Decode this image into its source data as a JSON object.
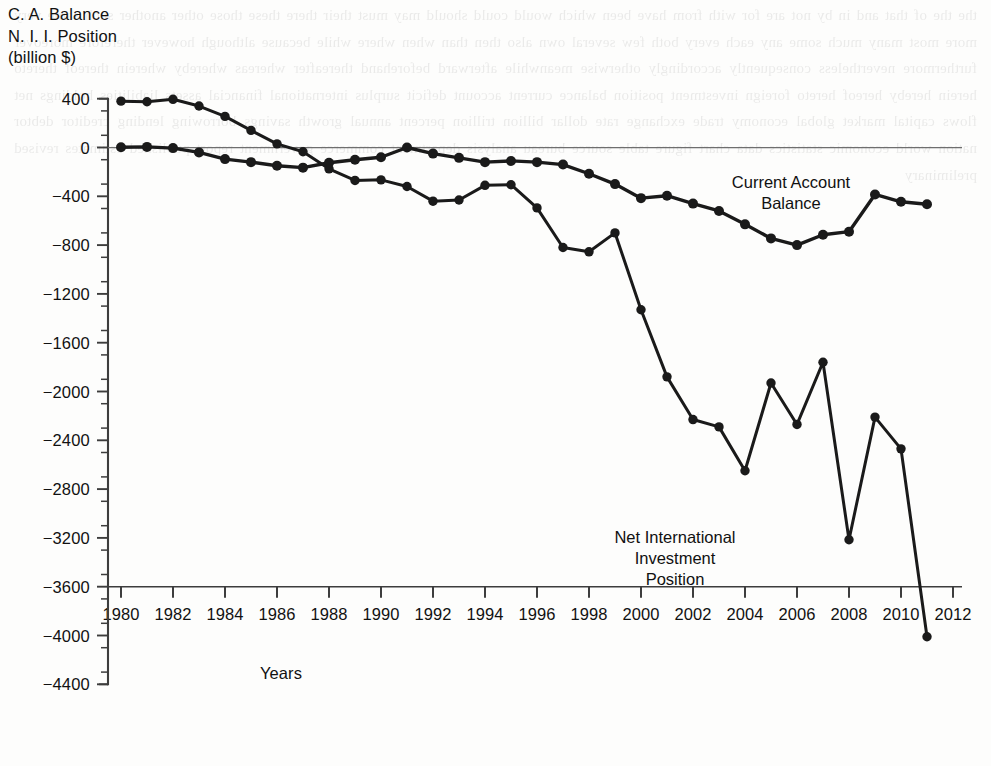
{
  "axes": {
    "y_title": "C. A. Balance\nN. I. I. Position\n(billion $)",
    "x_title": "Years",
    "y_ticks": [
      "400",
      "0",
      "−400",
      "−800",
      "−1200",
      "−1600",
      "−2000",
      "−2400",
      "−2800",
      "−3200",
      "−3600",
      "−4000",
      "−4400"
    ],
    "x_ticks": [
      "1980",
      "1982",
      "1984",
      "1986",
      "1988",
      "1990",
      "1992",
      "1994",
      "1996",
      "1998",
      "2000",
      "2002",
      "2004",
      "2006",
      "2008",
      "2010",
      "2012"
    ]
  },
  "series_labels": {
    "current_account": "Current Account\nBalance",
    "nii": "Net International\nInvestment\nPosition"
  },
  "colors": {
    "line": "#1a1a1a",
    "axis": "#3d3d3d",
    "zero_line": "#6e6e6e",
    "background": "#fdfdfc"
  },
  "bleed_text": "the the of that and in by not are for with from have been which would could should may must their there these those other another such same very more most many much some any each every both few several own also then than when where while because although however therefore moreover furthermore nevertheless consequently accordingly otherwise meanwhile afterward beforehand thereafter whereas whereby wherein thereof thereto herein hereby hereof hereto foreign investment position balance current account deficit surplus international financial assets liabilities holdings net flows capital market global economy trade exchange rate dollar billion trillion percent annual growth savings borrowing lending creditor debtor nation world economic statistics data chart figure table source bureau analysis department commerce government report published estimates revised preliminary",
  "chart_data": {
    "type": "line",
    "title": "",
    "xlabel": "Years",
    "ylabel": "C. A. Balance / N. I. I. Position (billion $)",
    "xlim": [
      1979,
      2012.6
    ],
    "ylim": [
      -4400,
      400
    ],
    "grid": false,
    "legend": "inline-annotations",
    "x": [
      1980,
      1981,
      1982,
      1983,
      1984,
      1985,
      1986,
      1987,
      1988,
      1989,
      1990,
      1991,
      1992,
      1993,
      1994,
      1995,
      1996,
      1997,
      1998,
      1999,
      2000,
      2001,
      2002,
      2003,
      2004,
      2005,
      2006,
      2007,
      2008,
      2009,
      2010,
      2011
    ],
    "series": [
      {
        "name": "Current Account Balance",
        "values": [
          2,
          5,
          -5,
          -40,
          -95,
          -120,
          -150,
          -165,
          -125,
          -100,
          -80,
          0,
          -50,
          -85,
          -120,
          -110,
          -120,
          -140,
          -215,
          -300,
          -415,
          -395,
          -460,
          -520,
          -630,
          -745,
          -800,
          -715,
          -690,
          -385,
          -445,
          -465
        ]
      },
      {
        "name": "Net International Investment Position",
        "values": [
          380,
          375,
          395,
          340,
          255,
          140,
          30,
          -35,
          -175,
          -270,
          -265,
          -320,
          -440,
          -430,
          -310,
          -305,
          -495,
          -820,
          -855,
          -700,
          -1330,
          -1880,
          -2230,
          -2290,
          -2650,
          -1930,
          -2270,
          -1760,
          -3215,
          -2210,
          -2470,
          -4010
        ]
      }
    ]
  },
  "geometry": {
    "plot_left": 108,
    "plot_right": 962,
    "axis_x": 108,
    "y_for_400": 99,
    "y_for_0": 147.5,
    "px_per_400": 48.8,
    "x_1980": 121,
    "px_per_year": 26.0
  }
}
